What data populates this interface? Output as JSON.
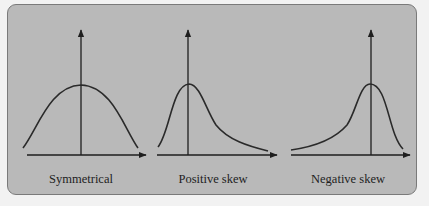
{
  "figure": {
    "background": "#b9b9b9",
    "stroke": "#1e1e1e",
    "panels": [
      {
        "id": "symmetrical",
        "label": "Symmetrical",
        "label_x": 81
      },
      {
        "id": "positive",
        "label": "Positive skew",
        "label_x": 213
      },
      {
        "id": "negative",
        "label": "Negative skew",
        "label_x": 348
      }
    ]
  }
}
